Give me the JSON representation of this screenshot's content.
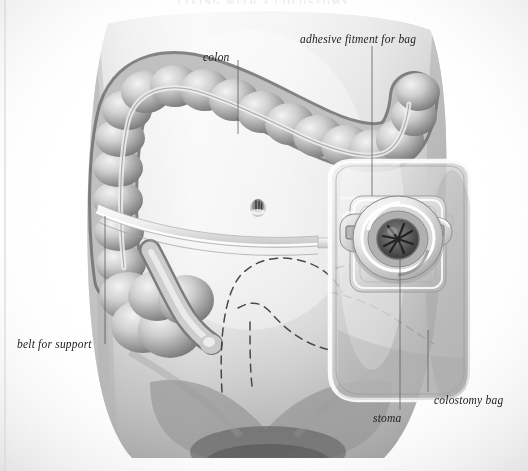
{
  "page": {
    "width": 528,
    "height": 471,
    "background": "#ffffff",
    "header_text": "LIVING WITH A COLOSTOMY",
    "border_color": "#d8d8dc"
  },
  "figure": {
    "style": "grayscale-airbrush",
    "skin_light": "#f2f2f2",
    "skin_mid": "#d2d2d2",
    "skin_shadow": "#a8a8a8",
    "colon_light": "#e8e8e8",
    "colon_mid": "#b4b4b4",
    "colon_dark": "#767676",
    "bag_fill": "#c8c8c8",
    "bag_edge": "#f4f4f4",
    "outline": "#3a3a3a",
    "dashed_line": "#3c3c3c",
    "leader_color": "#58585a"
  },
  "labels": [
    {
      "id": "colon",
      "text": "colon",
      "x": 203,
      "y": 51,
      "leader": {
        "x1": 238,
        "y1": 60,
        "x2": 238,
        "y2": 134
      }
    },
    {
      "id": "adhesive-fitment",
      "text": "adhesive fitment for bag",
      "x": 300,
      "y": 33,
      "leader": {
        "x1": 372,
        "y1": 46,
        "x2": 372,
        "y2": 196
      }
    },
    {
      "id": "belt-for-support",
      "text": "belt for support",
      "x": 17,
      "y": 338,
      "leader": {
        "x1": 105,
        "y1": 344,
        "x2": 105,
        "y2": 216
      }
    },
    {
      "id": "stoma",
      "text": "stoma",
      "x": 373,
      "y": 412,
      "leader": {
        "x1": 400,
        "y1": 410,
        "x2": 400,
        "y2": 243
      }
    },
    {
      "id": "colostomy-bag",
      "text": "colostomy bag",
      "x": 434,
      "y": 394,
      "leader": {
        "x1": 428,
        "y1": 392,
        "x2": 428,
        "y2": 330
      }
    }
  ],
  "anatomy": {
    "parts": [
      {
        "name": "torso",
        "note": "front view of lower abdomen and hips"
      },
      {
        "name": "ascending-colon",
        "note": "left side of image, vertical haustrated segment"
      },
      {
        "name": "transverse-colon",
        "note": "arching across upper abdomen"
      },
      {
        "name": "descending-colon",
        "note": "right side of image descending"
      },
      {
        "name": "sigmoid-colon",
        "note": "lower looping segment ending near stoma"
      },
      {
        "name": "navel",
        "note": "small dark vertical slit at center abdomen"
      },
      {
        "name": "support-belt",
        "note": "pale band crossing the abdomen horizontally"
      },
      {
        "name": "colostomy-bag",
        "note": "translucent rounded pouch on right abdomen"
      },
      {
        "name": "adhesive-flange",
        "note": "square adhesive wafer behind the ring"
      },
      {
        "name": "stoma-ring",
        "note": "circular coupling ring with dark central opening"
      },
      {
        "name": "belt-clip-left",
        "note": "belt attachment tab on left of flange"
      },
      {
        "name": "belt-clip-right",
        "note": "belt attachment tab on right of flange"
      },
      {
        "name": "underwear-outline",
        "note": "dashed lines indicating briefs"
      }
    ]
  }
}
